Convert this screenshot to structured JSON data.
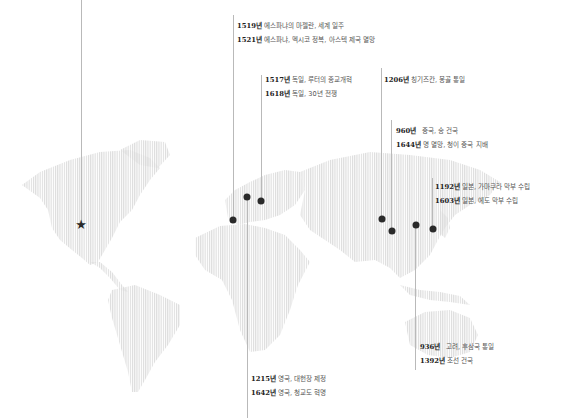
{
  "map": {
    "type": "dotted-world-map",
    "land_color": "#e6e6e6",
    "marker_color": "#2a2a2a",
    "line_color": "#b9b9b9",
    "origin_marker": {
      "icon": "star-icon",
      "glyph": "★",
      "region": "North America"
    }
  },
  "groups": [
    {
      "id": "spain",
      "events": [
        {
          "year": "1519년",
          "text": "에스파냐의 마젤란, 세계 일주"
        },
        {
          "year": "1521년",
          "text": "에스파냐, 멕시코 정복, 아스텍 제국 멸망"
        }
      ]
    },
    {
      "id": "germany",
      "events": [
        {
          "year": "1517년",
          "text": "독일, 루터의 종교개혁"
        },
        {
          "year": "1618년",
          "text": "독일, 30년 전쟁"
        }
      ]
    },
    {
      "id": "mongol",
      "events": [
        {
          "year": "1206년",
          "text": "칭기즈칸, 몽골 통일"
        }
      ]
    },
    {
      "id": "china",
      "events": [
        {
          "year": "960년",
          "text": "중국, 송 건국"
        },
        {
          "year": "1644년",
          "text": "명 멸망, 청이 중국 지배"
        }
      ]
    },
    {
      "id": "japan",
      "events": [
        {
          "year": "1192년",
          "text": "일본, 가마쿠라 막부 수립"
        },
        {
          "year": "1603년",
          "text": "일본, 에도 막부 수립"
        }
      ]
    },
    {
      "id": "korea",
      "events": [
        {
          "year": "936년",
          "text": "고려, 후삼국 통일"
        },
        {
          "year": "1392년",
          "text": "조선 건국"
        }
      ]
    },
    {
      "id": "england",
      "events": [
        {
          "year": "1215년",
          "text": "영국, 대헌장 제정"
        },
        {
          "year": "1642년",
          "text": "영국, 청교도 혁명"
        }
      ]
    }
  ]
}
